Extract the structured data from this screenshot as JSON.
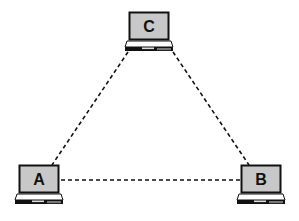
{
  "diagram": {
    "type": "network-topology",
    "layout": "triangle",
    "colors": {
      "background": "#ffffff",
      "screen_fill": "#c8c8c8",
      "outline": "#111111",
      "edge": "#111111"
    },
    "nodes": [
      {
        "id": "C",
        "label": "C",
        "icon": "laptop-icon",
        "x": 124,
        "y": 11
      },
      {
        "id": "A",
        "label": "A",
        "icon": "laptop-icon",
        "x": 14,
        "y": 164
      },
      {
        "id": "B",
        "label": "B",
        "icon": "laptop-icon",
        "x": 236,
        "y": 164
      }
    ],
    "edges": [
      {
        "from": "C",
        "to": "A",
        "style": "dashed"
      },
      {
        "from": "C",
        "to": "B",
        "style": "dashed"
      },
      {
        "from": "A",
        "to": "B",
        "style": "dashed"
      }
    ]
  }
}
